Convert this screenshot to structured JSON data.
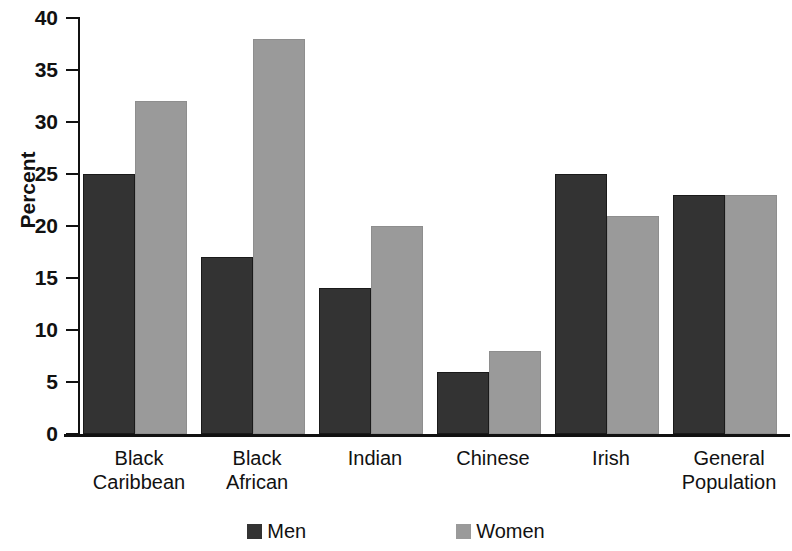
{
  "chart_data": {
    "type": "bar",
    "title": "",
    "xlabel": "",
    "ylabel": "Percent",
    "ylim": [
      0,
      40
    ],
    "yticks": [
      0,
      5,
      10,
      15,
      20,
      25,
      30,
      35,
      40
    ],
    "grid": false,
    "legend_position": "bottom",
    "categories": [
      "Black Caribbean",
      "Black African",
      "Indian",
      "Chinese",
      "Irish",
      "General Population"
    ],
    "category_lines": [
      [
        "Black",
        "Caribbean"
      ],
      [
        "Black",
        "African"
      ],
      [
        "Indian",
        ""
      ],
      [
        "Chinese",
        ""
      ],
      [
        "Irish",
        ""
      ],
      [
        "General",
        "Population"
      ]
    ],
    "series": [
      {
        "name": "Men",
        "color": "#333333",
        "values": [
          25,
          17,
          14,
          6,
          25,
          23
        ]
      },
      {
        "name": "Women",
        "color": "#9a9a9a",
        "values": [
          32,
          38,
          20,
          8,
          21,
          23
        ]
      }
    ]
  },
  "legend": {
    "items": [
      {
        "label": "Men",
        "color": "#333333"
      },
      {
        "label": "Women",
        "color": "#9a9a9a"
      }
    ]
  }
}
